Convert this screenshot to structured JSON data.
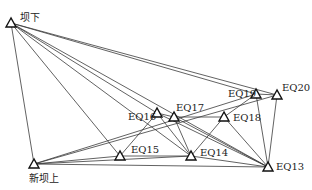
{
  "diagram": {
    "type": "monitoring-network",
    "nodes": [
      {
        "id": "badown",
        "label": "坝下",
        "x": 11,
        "y": 23,
        "lx": 20,
        "ly": 21,
        "anchor": "start"
      },
      {
        "id": "EQ16",
        "label": "EQ16",
        "x": 157,
        "y": 113,
        "lx": 128,
        "ly": 120,
        "anchor": "start"
      },
      {
        "id": "EQ17",
        "label": "EQ17",
        "x": 174,
        "y": 117,
        "lx": 176,
        "ly": 111,
        "anchor": "start"
      },
      {
        "id": "EQ19",
        "label": "EQ19",
        "x": 256,
        "y": 94,
        "lx": 228,
        "ly": 97,
        "anchor": "start"
      },
      {
        "id": "EQ20",
        "label": "EQ20",
        "x": 277,
        "y": 95,
        "lx": 282,
        "ly": 91,
        "anchor": "start"
      },
      {
        "id": "EQ18",
        "label": "EQ18",
        "x": 224,
        "y": 117,
        "lx": 233,
        "ly": 121,
        "anchor": "start"
      },
      {
        "id": "EQ15",
        "label": "EQ15",
        "x": 120,
        "y": 156,
        "lx": 131,
        "ly": 153,
        "anchor": "start"
      },
      {
        "id": "EQ14",
        "label": "EQ14",
        "x": 191,
        "y": 156,
        "lx": 200,
        "ly": 156,
        "anchor": "start"
      },
      {
        "id": "newbaup",
        "label": "新坝上",
        "x": 34,
        "y": 164,
        "lx": 29,
        "ly": 182,
        "anchor": "start"
      },
      {
        "id": "EQ13",
        "label": "EQ13",
        "x": 268,
        "y": 167,
        "lx": 276,
        "ly": 170,
        "anchor": "start"
      }
    ],
    "edges": [
      [
        "badown",
        "newbaup"
      ],
      [
        "badown",
        "EQ15"
      ],
      [
        "badown",
        "EQ16"
      ],
      [
        "badown",
        "EQ14"
      ],
      [
        "badown",
        "EQ13"
      ],
      [
        "badown",
        "EQ19"
      ],
      [
        "badown",
        "EQ20"
      ],
      [
        "newbaup",
        "EQ15"
      ],
      [
        "newbaup",
        "EQ14"
      ],
      [
        "newbaup",
        "EQ13"
      ],
      [
        "newbaup",
        "EQ19"
      ],
      [
        "newbaup",
        "EQ20"
      ],
      [
        "EQ15",
        "EQ16"
      ],
      [
        "EQ15",
        "EQ14"
      ],
      [
        "EQ16",
        "EQ17"
      ],
      [
        "EQ16",
        "EQ13"
      ],
      [
        "EQ17",
        "EQ14"
      ],
      [
        "EQ17",
        "EQ18"
      ],
      [
        "EQ17",
        "EQ13"
      ],
      [
        "EQ18",
        "EQ14"
      ],
      [
        "EQ18",
        "EQ13"
      ],
      [
        "EQ18",
        "EQ19"
      ],
      [
        "EQ19",
        "EQ20"
      ],
      [
        "EQ19",
        "EQ13"
      ],
      [
        "EQ20",
        "EQ13"
      ],
      [
        "EQ14",
        "EQ13"
      ],
      [
        "EQ16",
        "EQ14"
      ]
    ]
  }
}
